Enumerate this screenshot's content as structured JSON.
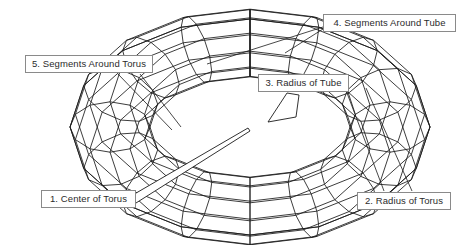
{
  "diagram": {
    "subject": "torus",
    "line_color": "#1a1a1a",
    "label_text_color": "#2b2b2b",
    "label_border_color": "#8a8a8a",
    "background_color": "#ffffff"
  },
  "callouts": [
    {
      "id": "center-of-torus",
      "number": "1",
      "label": "1. Center of Torus",
      "x": 41,
      "y": 190,
      "width": 95,
      "points_to": "center point of the torus hole"
    },
    {
      "id": "radius-of-torus",
      "number": "2",
      "label": "2. Radius of Torus",
      "x": 357,
      "y": 192,
      "width": 94,
      "points_to": "outer sweep radius of the torus ring"
    },
    {
      "id": "radius-of-tube",
      "number": "3",
      "label": "3. Radius of Tube",
      "x": 258,
      "y": 74,
      "width": 91,
      "points_to": "cross-section tube radius"
    },
    {
      "id": "segments-around-tube",
      "number": "4",
      "label": "4. Segments Around Tube",
      "x": 323,
      "y": 14,
      "width": 133,
      "points_to": "mesh divisions around the tube cross-section"
    },
    {
      "id": "segments-around-torus",
      "number": "5",
      "label": "5. Segments Around Torus",
      "x": 25,
      "y": 55,
      "width": 128,
      "points_to": "mesh divisions around the torus sweep"
    }
  ],
  "geometry": {
    "center_x": 250,
    "center_y": 127,
    "major_radius_x": 140,
    "major_radius_y": 84,
    "tube_radius": 40,
    "segments_around_torus": 16,
    "segments_around_tube": 12,
    "tilt_factor": 0.6
  }
}
